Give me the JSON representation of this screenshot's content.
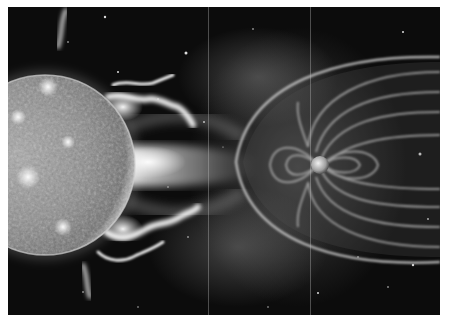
{
  "image": {
    "description": "Grayscale illustration of the Sun emitting solar wind and flares toward Earth, whose magnetosphere deflects the flow",
    "colors": {
      "background": "#ffffff",
      "space": "#0c0c0c",
      "sun_surface": "#8a8a8a",
      "flare": "#f2f2f2",
      "field_line": "#9a9a9a"
    },
    "elements": [
      {
        "name": "sun",
        "label": "Sun"
      },
      {
        "name": "solar-flares",
        "label": "Solar flares / prominences"
      },
      {
        "name": "solar-wind",
        "label": "Solar wind stream"
      },
      {
        "name": "bow-shock",
        "label": "Bow shock"
      },
      {
        "name": "magnetosphere-field-lines",
        "label": "Magnetic field lines"
      },
      {
        "name": "earth",
        "label": "Earth"
      },
      {
        "name": "starfield",
        "label": "Stars"
      }
    ]
  }
}
